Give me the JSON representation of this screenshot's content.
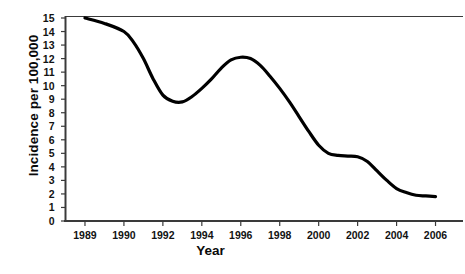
{
  "chart_data": {
    "type": "line",
    "title": "",
    "xlabel": "Year",
    "ylabel": "Incidence per 100,000",
    "xlim": [
      1989,
      2006
    ],
    "ylim": [
      0,
      15
    ],
    "grid": false,
    "legend": null,
    "line_color": "#000000",
    "x_tick_labels": [
      "1989",
      "1990",
      "1992",
      "1994",
      "1996",
      "1998",
      "2000",
      "2002",
      "2004",
      "2006"
    ],
    "y_tick_labels": [
      "0",
      "1",
      "2",
      "3",
      "4",
      "5",
      "6",
      "7",
      "8",
      "9",
      "10",
      "11",
      "12",
      "13",
      "14",
      "15"
    ],
    "series": [
      {
        "name": "Incidence",
        "x": [
          1989,
          1989.5,
          1990,
          1990.5,
          1991,
          1991.5,
          1992,
          1992.5,
          1993,
          1993.5,
          1994,
          1994.5,
          1995,
          1995.5,
          1996,
          1996.5,
          1997,
          1997.5,
          1998,
          1998.5,
          1999,
          1999.5,
          2000,
          2000.5,
          2001,
          2001.5,
          2002,
          2002.5,
          2003,
          2003.5,
          2004,
          2004.5,
          2005,
          2005.5,
          2006
        ],
        "values": [
          15.0,
          14.6,
          14.0,
          13.2,
          12.0,
          10.5,
          9.3,
          8.85,
          8.8,
          9.2,
          9.8,
          10.5,
          11.3,
          11.9,
          12.1,
          12.0,
          11.5,
          10.7,
          9.8,
          8.8,
          7.7,
          6.6,
          5.6,
          5.0,
          4.85,
          4.8,
          4.75,
          4.4,
          3.7,
          3.0,
          2.4,
          2.1,
          1.9,
          1.85,
          1.8
        ]
      }
    ],
    "annotations": []
  }
}
